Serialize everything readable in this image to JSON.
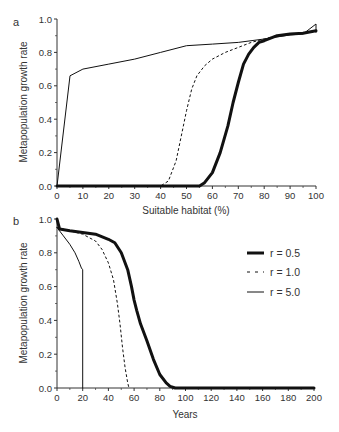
{
  "chart_data": [
    {
      "panel": "a",
      "type": "line",
      "xlabel": "Suitable habitat (%)",
      "ylabel": "Metapopulation growth rate",
      "xlim": [
        0,
        100
      ],
      "ylim": [
        0,
        1.0
      ],
      "xticks": [
        "0",
        "10",
        "20",
        "30",
        "40",
        "50",
        "60",
        "70",
        "80",
        "90",
        "100"
      ],
      "yticks": [
        "0.0",
        "0.2",
        "0.4",
        "0.6",
        "0.8",
        "1.0"
      ],
      "grid": false,
      "series": [
        {
          "name": "r = 0.5",
          "style": "thick-solid",
          "x": [
            0,
            40,
            50,
            55,
            57,
            60,
            63,
            66,
            68,
            70,
            72,
            74,
            76,
            78,
            80,
            85,
            90,
            95,
            100
          ],
          "y": [
            0.0,
            0.0,
            0.0,
            0.0,
            0.02,
            0.08,
            0.2,
            0.36,
            0.5,
            0.62,
            0.73,
            0.79,
            0.83,
            0.86,
            0.87,
            0.9,
            0.91,
            0.915,
            0.93
          ]
        },
        {
          "name": "r = 1.0",
          "style": "dashed",
          "x": [
            0,
            40,
            43,
            46,
            48,
            50,
            52,
            54,
            57,
            60,
            65,
            70,
            75,
            80,
            85,
            90,
            95,
            100
          ],
          "y": [
            0.0,
            0.0,
            0.03,
            0.15,
            0.3,
            0.45,
            0.58,
            0.66,
            0.72,
            0.76,
            0.8,
            0.83,
            0.86,
            0.88,
            0.9,
            0.91,
            0.915,
            0.93
          ]
        },
        {
          "name": "r = 5.0",
          "style": "thin-solid",
          "x": [
            0,
            5,
            10,
            20,
            30,
            40,
            50,
            60,
            70,
            80,
            90,
            95,
            100,
            100
          ],
          "y": [
            0.0,
            0.66,
            0.7,
            0.73,
            0.76,
            0.8,
            0.84,
            0.85,
            0.86,
            0.88,
            0.905,
            0.91,
            0.97,
            0.92
          ]
        }
      ]
    },
    {
      "panel": "b",
      "type": "line",
      "xlabel": "Years",
      "ylabel": "Metapopulation growth rate",
      "xlim": [
        0,
        200
      ],
      "ylim": [
        0,
        1.0
      ],
      "xticks": [
        "0",
        "20",
        "40",
        "60",
        "80",
        "100",
        "120",
        "140",
        "160",
        "180",
        "200"
      ],
      "yticks": [
        "0.0",
        "0.2",
        "0.4",
        "0.6",
        "0.8",
        "1.0"
      ],
      "grid": false,
      "legend": {
        "position": "upper right",
        "entries": [
          "r = 0.5",
          "r = 1.0",
          "r = 5.0"
        ]
      },
      "series": [
        {
          "name": "r = 0.5",
          "style": "thick-solid",
          "x": [
            0,
            2,
            10,
            20,
            30,
            40,
            45,
            50,
            55,
            58,
            60,
            62,
            65,
            70,
            75,
            80,
            85,
            88,
            92,
            100,
            200
          ],
          "y": [
            1.0,
            0.94,
            0.93,
            0.92,
            0.91,
            0.88,
            0.86,
            0.8,
            0.7,
            0.6,
            0.52,
            0.46,
            0.38,
            0.28,
            0.17,
            0.08,
            0.03,
            0.01,
            0.0,
            0.0,
            0.0
          ]
        },
        {
          "name": "r = 1.0",
          "style": "dashed",
          "x": [
            0,
            10,
            20,
            30,
            35,
            40,
            44,
            47,
            49,
            51,
            53,
            55,
            56
          ],
          "y": [
            0.95,
            0.93,
            0.91,
            0.87,
            0.82,
            0.74,
            0.64,
            0.5,
            0.38,
            0.24,
            0.12,
            0.03,
            0.0
          ]
        },
        {
          "name": "r = 5.0",
          "style": "thin-solid",
          "x": [
            0,
            5,
            10,
            14,
            17,
            19,
            20,
            20
          ],
          "y": [
            0.95,
            0.9,
            0.85,
            0.8,
            0.75,
            0.71,
            0.7,
            0.0
          ]
        }
      ]
    }
  ],
  "panels": {
    "a": {
      "label": "a",
      "xlabel": "Suitable habitat (%)",
      "ylabel": "Metapopulation growth rate",
      "xticks": [
        "0",
        "10",
        "20",
        "30",
        "40",
        "50",
        "60",
        "70",
        "80",
        "90",
        "100"
      ],
      "yticks": [
        "0.0",
        "0.2",
        "0.4",
        "0.6",
        "0.8",
        "1.0"
      ]
    },
    "b": {
      "label": "b",
      "xlabel": "Years",
      "ylabel": "Metapopulation growth rate",
      "xticks": [
        "0",
        "20",
        "40",
        "60",
        "80",
        "100",
        "120",
        "140",
        "160",
        "180",
        "200"
      ],
      "yticks": [
        "0.0",
        "0.2",
        "0.4",
        "0.6",
        "0.8",
        "1.0"
      ]
    }
  },
  "legend": {
    "entries": [
      {
        "label": "r = 0.5",
        "style": "thick-solid"
      },
      {
        "label": "r = 1.0",
        "style": "dashed"
      },
      {
        "label": "r = 5.0",
        "style": "thin-solid"
      }
    ]
  },
  "colors": {
    "line": "#111111",
    "axis": "#333333",
    "background": "#ffffff"
  }
}
